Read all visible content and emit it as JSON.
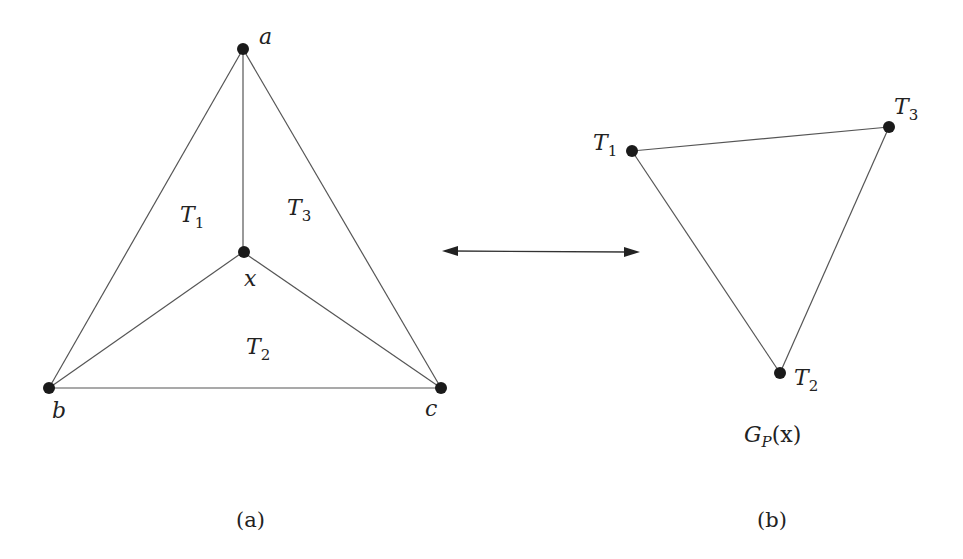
{
  "panel_a": {
    "caption": "(a)",
    "vertices": {
      "a": "a",
      "b": "b",
      "c": "c",
      "x": "x"
    },
    "regions": [
      {
        "base": "T",
        "sub": "1"
      },
      {
        "base": "T",
        "sub": "2"
      },
      {
        "base": "T",
        "sub": "3"
      }
    ],
    "edges": [
      [
        "a",
        "b"
      ],
      [
        "a",
        "c"
      ],
      [
        "b",
        "c"
      ],
      [
        "a",
        "x"
      ],
      [
        "b",
        "x"
      ],
      [
        "c",
        "x"
      ]
    ]
  },
  "connector": {
    "type": "double-headed-arrow",
    "meaning": "correspondence"
  },
  "panel_b": {
    "caption": "(b)",
    "graph_label": {
      "base": "G",
      "sub": "P",
      "arg": "(x)"
    },
    "nodes": [
      {
        "id": "T1",
        "base": "T",
        "sub": "1"
      },
      {
        "id": "T2",
        "base": "T",
        "sub": "2"
      },
      {
        "id": "T3",
        "base": "T",
        "sub": "3"
      }
    ],
    "edges": [
      [
        "T1",
        "T3"
      ],
      [
        "T1",
        "T2"
      ],
      [
        "T2",
        "T3"
      ]
    ]
  }
}
